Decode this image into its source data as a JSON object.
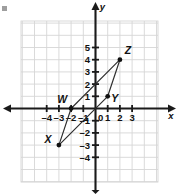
{
  "chart_data": {
    "type": "scatter",
    "title": "",
    "xlabel": "x",
    "ylabel": "y",
    "xlim": [
      -6,
      5
    ],
    "ylim": [
      -5,
      6
    ],
    "grid": true,
    "grid_step": 1,
    "legend": "none",
    "x_tick_labels": [
      "–4",
      "–3",
      "–2",
      "–1",
      "0",
      "1",
      "2",
      "3"
    ],
    "x_tick_values": [
      -4,
      -3,
      -2,
      -1,
      0,
      1,
      2,
      3
    ],
    "y_tick_labels": [
      "5",
      "4",
      "3",
      "2",
      "1",
      "–1",
      "–2",
      "–3",
      "–4"
    ],
    "y_tick_values": [
      5,
      4,
      3,
      2,
      1,
      -1,
      -2,
      -3,
      -4
    ],
    "points": [
      {
        "label": "W",
        "x": -2,
        "y": 0,
        "label_dx": -9,
        "label_dy": -6
      },
      {
        "label": "X",
        "x": -3,
        "y": -3,
        "label_dx": -11,
        "label_dy": -2
      },
      {
        "label": "Y",
        "x": 1,
        "y": 1,
        "label_dx": 7,
        "label_dy": 6
      },
      {
        "label": "Z",
        "x": 2,
        "y": 4,
        "label_dx": 8,
        "label_dy": -6
      }
    ],
    "edges": [
      [
        "W",
        "Z"
      ],
      [
        "Z",
        "Y"
      ],
      [
        "Y",
        "X"
      ],
      [
        "X",
        "W"
      ]
    ],
    "shape_name": "WXYZ",
    "colors": {
      "grid": "#d6d6d6",
      "axis": "#1a1a1a",
      "segment": "#2b2b2b",
      "point": "#111111",
      "text": "#111111",
      "background": "#ffffff"
    }
  },
  "axes_labels": {
    "x_axis_label": "x",
    "y_axis_label": "y"
  }
}
